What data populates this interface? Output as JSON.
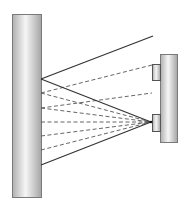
{
  "diagram": {
    "width": 187,
    "height": 209,
    "colors": {
      "background": "#ffffff",
      "stroke": "#333333",
      "bar_edge": "#9a9a9a",
      "bar_light": "#f4f4f4",
      "bar_dark": "#a8a8a8"
    },
    "left_bar": {
      "x": 12,
      "y": 14,
      "w": 29,
      "h": 183
    },
    "right_bar": {
      "x": 160,
      "y": 54,
      "w": 17,
      "h": 88
    },
    "tabs": [
      {
        "name": "upper-tab",
        "x": 152,
        "y": 64,
        "w": 8,
        "h": 16
      },
      {
        "name": "lower-tab",
        "x": 152,
        "y": 114,
        "w": 8,
        "h": 17
      }
    ],
    "focal_point": {
      "x": 151,
      "y": 122
    },
    "solid_lines": [
      {
        "x1": 41,
        "y1": 79,
        "x2": 153,
        "y2": 36
      },
      {
        "x1": 41,
        "y1": 79,
        "x2": 151,
        "y2": 122
      },
      {
        "x1": 41,
        "y1": 165,
        "x2": 151,
        "y2": 122
      }
    ],
    "dashed_lines": [
      {
        "x1": 41,
        "y1": 93,
        "x2": 152,
        "y2": 65
      },
      {
        "x1": 41,
        "y1": 108,
        "x2": 152,
        "y2": 93
      },
      {
        "x1": 41,
        "y1": 93,
        "x2": 151,
        "y2": 122
      },
      {
        "x1": 41,
        "y1": 108,
        "x2": 151,
        "y2": 122
      },
      {
        "x1": 41,
        "y1": 122,
        "x2": 151,
        "y2": 122
      },
      {
        "x1": 41,
        "y1": 136,
        "x2": 151,
        "y2": 122
      },
      {
        "x1": 41,
        "y1": 150,
        "x2": 151,
        "y2": 122
      }
    ]
  }
}
